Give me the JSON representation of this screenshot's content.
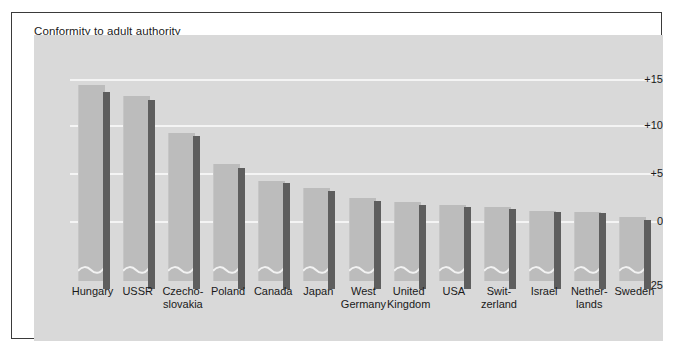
{
  "chart_data": {
    "type": "bar",
    "title": "Conformity to adult authority",
    "xlabel": "",
    "ylabel": "",
    "ylim": [
      -25,
      17
    ],
    "yticks": [
      "+15",
      "+10",
      "+5",
      "0",
      "-25"
    ],
    "ytick_values": [
      15,
      10,
      5,
      0,
      -25
    ],
    "grid": true,
    "axis_break": true,
    "legend": "none",
    "categories": [
      "Hungary",
      "USSR",
      "Czecho-slovakia",
      "Poland",
      "Canada",
      "Japan",
      "West Germany",
      "United Kingdom",
      "USA",
      "Switzerland",
      "Israel",
      "Netherlands",
      "Sweden"
    ],
    "category_lines": [
      [
        "Hungary"
      ],
      [
        "USSR"
      ],
      [
        "Czecho-",
        "slovakia"
      ],
      [
        "Poland"
      ],
      [
        "Canada"
      ],
      [
        "Japan"
      ],
      [
        "West",
        "Germany"
      ],
      [
        "United",
        "Kingdom"
      ],
      [
        "USA"
      ],
      [
        "Swit-",
        "zerland"
      ],
      [
        "Israel"
      ],
      [
        "Nether-",
        "lands"
      ],
      [
        "Sweden"
      ]
    ],
    "series": [
      {
        "name": "light-bar",
        "color": "#bcbcbc",
        "values": [
          14.3,
          13.2,
          9.3,
          6.0,
          4.2,
          3.5,
          2.4,
          2.0,
          1.7,
          1.5,
          1.1,
          1.0,
          0.4
        ]
      },
      {
        "name": "dark-bar",
        "color": "#5e5e5e",
        "values": [
          13.6,
          12.7,
          9.0,
          5.6,
          4.0,
          3.2,
          2.1,
          1.7,
          1.5,
          1.3,
          1.0,
          0.8,
          0.1
        ]
      }
    ]
  },
  "colors": {
    "page_background": "#ffffff",
    "frame_border": "#3a3a3a",
    "panel_background": "#d9d9d9",
    "gridline": "#f4f4f4",
    "light_bar": "#bcbcbc",
    "dark_bar": "#5e5e5e",
    "text": "#1a1a1a"
  }
}
